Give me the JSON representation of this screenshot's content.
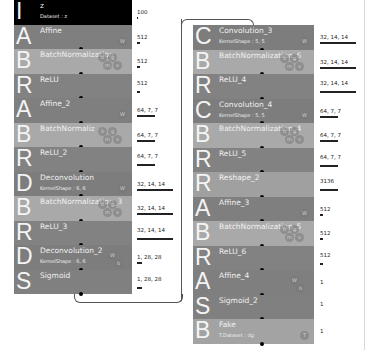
{
  "colors": {
    "input": "#000000",
    "affine": "#7f7f7f",
    "batchnorm": "#a9a9a9",
    "relu": "#828282",
    "conv": "#7d7d7d",
    "reshape": "#a0a0a0",
    "sigmoid": "#808080",
    "output": "#a3a3a3"
  },
  "left_column": [
    {
      "letter": "I",
      "name": "z",
      "sub": "Dataset : z",
      "shape": "100",
      "bar": 1,
      "type": "input"
    },
    {
      "letter": "A",
      "name": "Affine",
      "sub": "",
      "shape": "512",
      "bar": 3,
      "type": "affine",
      "params": [
        "W"
      ]
    },
    {
      "letter": "B",
      "name": "BatchNormalization",
      "sub": "",
      "shape": "512",
      "bar": 3,
      "type": "batchnorm",
      "params": [
        "b",
        "g",
        "m",
        "v"
      ]
    },
    {
      "letter": "R",
      "name": "ReLU",
      "sub": "",
      "shape": "512",
      "bar": 3,
      "type": "relu"
    },
    {
      "letter": "A",
      "name": "Affine_2",
      "sub": "",
      "shape": "64, 7, 7",
      "bar": 18,
      "type": "affine",
      "params": [
        "W"
      ]
    },
    {
      "letter": "B",
      "name": "BatchNormaliz",
      "sub": "",
      "shape": "64, 7, 7",
      "bar": 18,
      "type": "batchnorm",
      "params": [
        "b",
        "g",
        "m",
        "v"
      ]
    },
    {
      "letter": "R",
      "name": "ReLU_2",
      "sub": "",
      "shape": "64, 7, 7",
      "bar": 18,
      "type": "relu"
    },
    {
      "letter": "D",
      "name": "Deconvolution",
      "sub": "KernelShape : 6, 6",
      "shape": "32, 14, 14",
      "bar": 36,
      "type": "conv",
      "params": [
        "W"
      ]
    },
    {
      "letter": "B",
      "name": "BatchNormalization_3",
      "sub": "",
      "shape": "32, 14, 14",
      "bar": 36,
      "type": "batchnorm",
      "params": [
        "b",
        "g",
        "m",
        "v"
      ]
    },
    {
      "letter": "R",
      "name": "ReLU_3",
      "sub": "",
      "shape": "32, 14, 14",
      "bar": 36,
      "type": "relu"
    },
    {
      "letter": "D",
      "name": "Deconvolution_2",
      "sub": "KernelShape : 6, 6",
      "shape": "1, 28, 28",
      "bar": 5,
      "type": "conv",
      "params": [
        "W",
        "b"
      ]
    },
    {
      "letter": "S",
      "name": "Sigmoid",
      "sub": "",
      "shape": "1, 28, 28",
      "bar": 5,
      "type": "sigmoid"
    }
  ],
  "right_column": [
    {
      "letter": "C",
      "name": "Convolution_3",
      "sub": "KernelShape : 5, 5",
      "shape": "32, 14, 14",
      "bar": 36,
      "type": "conv",
      "params": [
        "W"
      ]
    },
    {
      "letter": "B",
      "name": "BatchNormalization_6",
      "sub": "",
      "shape": "32, 14, 14",
      "bar": 36,
      "type": "batchnorm",
      "params": [
        "b",
        "g",
        "m",
        "v"
      ]
    },
    {
      "letter": "R",
      "name": "ReLU_4",
      "sub": "",
      "shape": "32, 14, 14",
      "bar": 36,
      "type": "relu"
    },
    {
      "letter": "C",
      "name": "Convolution_4",
      "sub": "KernelShape : 5, 5",
      "shape": "64, 7, 7",
      "bar": 18,
      "type": "conv",
      "params": [
        "W"
      ]
    },
    {
      "letter": "B",
      "name": "BatchNormalization_4",
      "sub": "",
      "shape": "64, 7, 7",
      "bar": 18,
      "type": "batchnorm",
      "params": [
        "b",
        "g",
        "m",
        "v"
      ]
    },
    {
      "letter": "R",
      "name": "ReLU_5",
      "sub": "",
      "shape": "64, 7, 7",
      "bar": 18,
      "type": "relu"
    },
    {
      "letter": "R",
      "name": "Reshape_2",
      "sub": "",
      "shape": "3136",
      "bar": 18,
      "type": "reshape"
    },
    {
      "letter": "A",
      "name": "Affine_3",
      "sub": "",
      "shape": "512",
      "bar": 3,
      "type": "affine",
      "params": [
        "W"
      ]
    },
    {
      "letter": "B",
      "name": "BatchNormalization_5",
      "sub": "",
      "shape": "512",
      "bar": 3,
      "type": "batchnorm",
      "params": [
        "b",
        "g",
        "m",
        "v"
      ]
    },
    {
      "letter": "R",
      "name": "ReLU_6",
      "sub": "",
      "shape": "512",
      "bar": 3,
      "type": "relu"
    },
    {
      "letter": "A",
      "name": "Affine_4",
      "sub": "",
      "shape": "1",
      "bar": 0,
      "type": "affine",
      "params": [
        "W",
        "b"
      ]
    },
    {
      "letter": "S",
      "name": "Sigmoid_2",
      "sub": "",
      "shape": "1",
      "bar": 0,
      "type": "sigmoid"
    },
    {
      "letter": "B",
      "name": "Fake",
      "sub": "T.Dataset : dg",
      "shape": "1",
      "bar": 0,
      "type": "output",
      "params": [
        "T"
      ]
    }
  ]
}
